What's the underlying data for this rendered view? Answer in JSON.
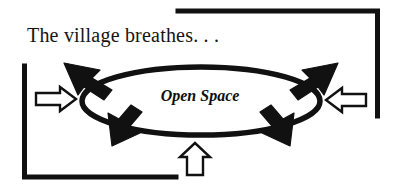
{
  "figure": {
    "caption": "The village breathes. . .",
    "center_label": "Open Space",
    "colors": {
      "ink": "#111111",
      "background": "#ffffff",
      "outline_arrow_fill": "#ffffff",
      "outline_arrow_stroke": "#111111"
    },
    "ellipse": {
      "center_x": 201,
      "center_y": 101,
      "radius_x": 119,
      "radius_y": 34,
      "stroke_width": 5
    },
    "brackets": [
      {
        "name": "top-right-bracket",
        "horizontal_from_x": 178,
        "horizontal_to_x": 378,
        "horizontal_y": 11,
        "vertical_x": 375,
        "vertical_from_y": 11,
        "vertical_to_y": 116,
        "stroke_width": 5
      },
      {
        "name": "bottom-left-bracket",
        "horizontal_from_x": 24,
        "horizontal_to_x": 176,
        "horizontal_y": 177,
        "vertical_x": 24,
        "vertical_from_y": 66,
        "vertical_to_y": 177,
        "stroke_width": 5
      }
    ],
    "outline_arrows": [
      {
        "name": "inflow-arrow-left",
        "direction": "right",
        "x": 36,
        "y": 89
      },
      {
        "name": "inflow-arrow-right",
        "direction": "left",
        "x": 324,
        "y": 90
      },
      {
        "name": "inflow-arrow-bottom",
        "direction": "up",
        "x": 186,
        "y": 148
      }
    ],
    "cycle_arrowheads": [
      {
        "name": "cycle-arrow-top-left",
        "direction": "up-left"
      },
      {
        "name": "cycle-arrow-top-right",
        "direction": "up-right"
      },
      {
        "name": "cycle-arrow-bottom-left",
        "direction": "down-left"
      },
      {
        "name": "cycle-arrow-bottom-right",
        "direction": "down-right"
      }
    ]
  }
}
